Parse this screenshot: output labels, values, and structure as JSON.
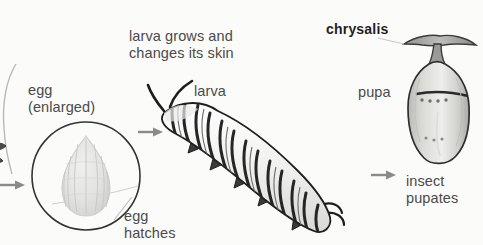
{
  "diagram": {
    "title_concept": "butterfly life cycle",
    "background_color": "#fbfbfa",
    "ink_color": "#3a3a3a"
  },
  "labels": {
    "egg_enlarged": "egg\n(enlarged)",
    "egg_hatches": "egg\nhatches",
    "larva_grows": "larva grows and\nchanges its skin",
    "larva": "larva",
    "chrysalis": "chrysalis",
    "pupa": "pupa",
    "insect_pupates": "insect\npupates"
  },
  "stages": [
    {
      "name": "egg",
      "label": "egg (enlarged)",
      "art": "egg-in-circle"
    },
    {
      "name": "larva",
      "label": "larva",
      "art": "striped-caterpillar"
    },
    {
      "name": "pupa",
      "label": "pupa",
      "art": "chrysalis-shape"
    }
  ],
  "arrows": [
    {
      "name": "arrow-into-egg",
      "direction": "right"
    },
    {
      "name": "arrow-egg-to-larva",
      "direction": "right"
    },
    {
      "name": "arrow-larva-to-pupa",
      "direction": "right"
    }
  ]
}
